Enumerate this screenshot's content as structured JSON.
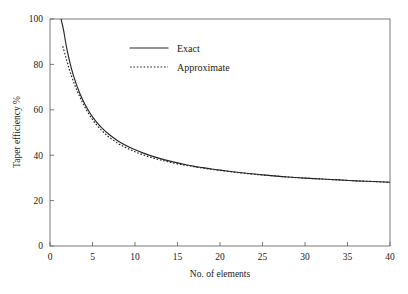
{
  "chart_data": {
    "type": "line",
    "title": "",
    "xlabel": "No. of elements",
    "ylabel": "Taper efficiency %",
    "xlim": [
      0,
      40
    ],
    "ylim": [
      0,
      100
    ],
    "xticks": [
      0,
      5,
      10,
      15,
      20,
      25,
      30,
      35,
      40
    ],
    "yticks": [
      0,
      20,
      40,
      60,
      80,
      100
    ],
    "xtick_labels": [
      "0",
      "5",
      "10",
      "15",
      "20",
      "25",
      "30",
      "35",
      "40"
    ],
    "ytick_labels": [
      "0",
      "20",
      "40",
      "60",
      "80",
      "100"
    ],
    "grid": false,
    "legend_position": "upper-center",
    "series": [
      {
        "name": "Exact",
        "style": "solid",
        "color": "#262626",
        "x": [
          1.3,
          1.6,
          2.0,
          2.5,
          3.0,
          3.5,
          4.0,
          4.5,
          5.0,
          5.5,
          6.0,
          7.0,
          8.0,
          9.0,
          10.0,
          11.0,
          12.0,
          13.0,
          14.0,
          15.0,
          16.0,
          17.0,
          18.0,
          19.0,
          20.0,
          22.0,
          24.0,
          26.0,
          28.0,
          30.0,
          32.0,
          34.0,
          36.0,
          38.0,
          40.0
        ],
        "values": [
          100.0,
          95.0,
          86.5,
          78.5,
          72.3,
          67.3,
          63.2,
          59.8,
          56.9,
          54.5,
          52.4,
          49.0,
          46.3,
          44.2,
          42.4,
          40.9,
          39.6,
          38.5,
          37.5,
          36.6,
          35.8,
          35.1,
          34.5,
          33.9,
          33.4,
          32.5,
          31.7,
          31.0,
          30.4,
          29.9,
          29.5,
          29.1,
          28.7,
          28.4,
          28.1
        ]
      },
      {
        "name": "Approximate",
        "style": "dotted",
        "color": "#262626",
        "x": [
          1.5,
          1.8,
          2.1,
          2.4,
          2.8,
          3.2,
          3.6,
          4.0,
          4.5,
          5.0,
          5.5,
          6.0,
          6.5,
          7.0,
          8.0,
          9.0,
          10.0,
          11.0,
          12.0,
          13.0,
          14.0,
          15.0,
          16.0,
          17.0,
          18.0,
          19.0,
          20.0,
          22.0,
          24.0,
          26.0,
          28.0,
          30.0,
          32.0,
          34.0,
          36.0,
          38.0,
          40.0
        ],
        "values": [
          88.0,
          84.0,
          80.0,
          76.3,
          72.0,
          68.3,
          65.0,
          62.0,
          58.6,
          55.7,
          53.3,
          51.2,
          49.4,
          47.8,
          45.2,
          43.2,
          41.5,
          40.1,
          38.9,
          37.9,
          37.0,
          36.2,
          35.5,
          34.9,
          34.3,
          33.8,
          33.3,
          32.4,
          31.6,
          31.0,
          30.4,
          29.9,
          29.5,
          29.1,
          28.7,
          28.4,
          28.1
        ]
      }
    ]
  },
  "legend": {
    "entries": [
      {
        "label": "Exact",
        "style": "solid"
      },
      {
        "label": "Approximate",
        "style": "dotted"
      }
    ]
  }
}
